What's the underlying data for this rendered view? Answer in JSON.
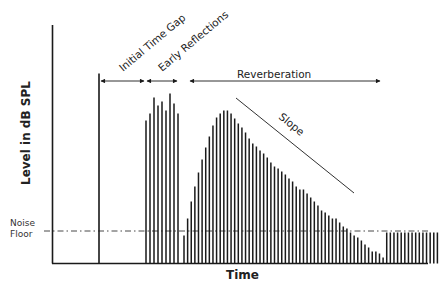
{
  "chart_data": {
    "type": "bar",
    "title": "",
    "xlabel": "Time",
    "ylabel": "Level in dB SPL",
    "axes": {
      "x_ticks": [],
      "y_ticks": [],
      "grid": false
    },
    "reference_lines": [
      {
        "name": "Noise Floor",
        "style": "dash-dot",
        "y_px": 231
      }
    ],
    "direct_sound": {
      "x_px": 99,
      "top_px": 220
    },
    "early_reflections": {
      "x_start_px": 146,
      "spacing_px": 4,
      "heights_px": [
        143,
        150,
        166,
        158,
        162,
        153,
        170,
        160,
        150
      ]
    },
    "reverberation": {
      "x_start_px": 184,
      "spacing_px": 3.62,
      "heights_px": [
        28,
        45,
        62,
        77,
        91,
        104,
        116,
        127,
        138,
        146,
        150,
        153,
        153,
        150,
        145,
        140,
        136,
        131,
        125,
        120,
        117,
        113,
        110,
        106,
        101,
        97,
        95,
        92,
        89,
        85,
        82,
        77,
        74,
        74,
        70,
        66,
        62,
        58,
        53,
        51,
        48,
        45,
        45,
        41,
        37,
        35,
        31,
        28,
        26,
        23,
        19,
        16,
        12,
        12,
        10,
        6,
        31,
        31,
        31,
        31,
        31,
        31,
        31,
        31,
        31,
        31,
        31,
        31,
        31,
        31,
        31
      ],
      "note": "heights measured in pixels above baseline; trailing bars sit at the noise floor"
    },
    "annotations": [
      {
        "text": "Initial Time Gap",
        "type": "double-arrow",
        "from_px": 99,
        "to_px": 144
      },
      {
        "text": "Early Reflections",
        "type": "double-arrow",
        "from_px": 146,
        "to_px": 177
      },
      {
        "text": "Reverberation",
        "type": "double-arrow",
        "from_px": 189,
        "to_px": 376
      },
      {
        "text": "Slope",
        "type": "line",
        "from_px": [
          236,
          98
        ],
        "to_px": [
          354,
          193
        ]
      }
    ]
  },
  "labels": {
    "y_axis": "Level in dB SPL",
    "x_axis": "Time",
    "noise_floor_line1": "Noise",
    "noise_floor_line2": "Floor",
    "initial_time_gap": "Initial Time Gap",
    "early_reflections": "Early Reflections",
    "reverberation": "Reverberation",
    "slope": "Slope"
  },
  "colors": {
    "ink": "#1a1a1a",
    "background": "#ffffff"
  }
}
